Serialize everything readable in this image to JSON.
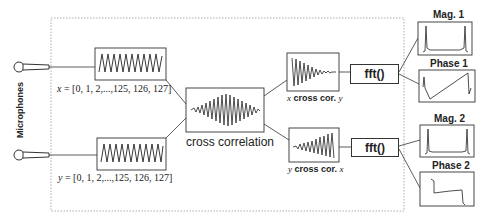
{
  "diagram": {
    "side_label": "Microphones",
    "x_signal": {
      "var": "x",
      "label": " = [0, 1, 2,...,125, 126, 127]"
    },
    "y_signal": {
      "var": "y",
      "label": " = [0, 1, 2,...,125, 126, 127]"
    },
    "cross_correlation": {
      "label": "cross correlation"
    },
    "x_cross_y": {
      "a": "x",
      "mid": " cross cor. ",
      "b": "y"
    },
    "y_cross_x": {
      "a": "y",
      "mid": " cross cor. ",
      "b": "x"
    },
    "fft_1": {
      "label": "fft()"
    },
    "fft_2": {
      "label": "fft()"
    },
    "outputs": {
      "mag1": "Mag. 1",
      "phase1": "Phase 1",
      "mag2": "Mag. 2",
      "phase2": "Phase 2"
    },
    "colors": {
      "line": "#333333",
      "dashed": "#888888",
      "background": "#ffffff"
    }
  }
}
